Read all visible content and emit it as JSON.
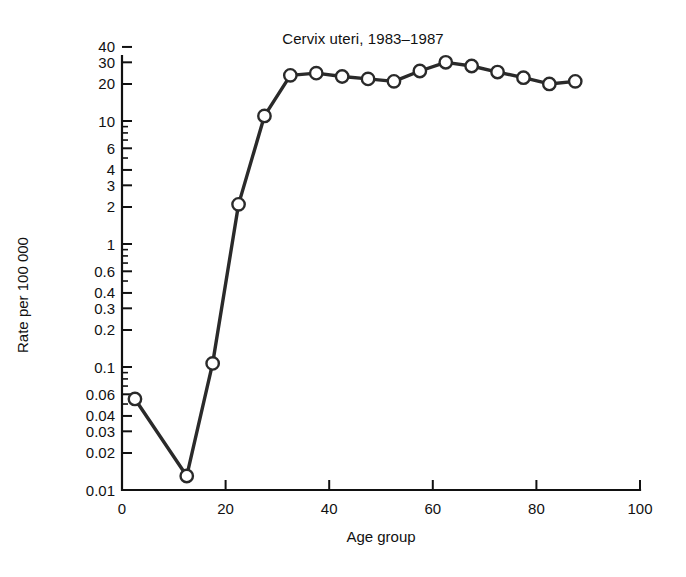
{
  "chart_data": {
    "type": "line",
    "title": "Cervix uteri, 1983–1987",
    "xlabel": "Age group",
    "ylabel": "Rate per 100 000",
    "yscale": "log",
    "xlim": [
      0,
      100
    ],
    "ylim": [
      0.01,
      45
    ],
    "grid": false,
    "legend": null,
    "xticks": [
      0,
      20,
      40,
      60,
      80,
      100
    ],
    "xtick_labels": [
      "0",
      "20",
      "40",
      "60",
      "80",
      "100"
    ],
    "yticks": [
      0.01,
      0.02,
      0.03,
      0.04,
      0.06,
      0.1,
      0.2,
      0.3,
      0.4,
      0.6,
      1,
      2,
      3,
      4,
      6,
      10,
      20,
      30,
      40
    ],
    "ytick_labels": [
      "0.01",
      "0.02",
      "0.03",
      "0.04",
      "0.06",
      "0.1",
      "0.2",
      "0.3",
      "0.4",
      "0.6",
      "1",
      "2",
      "3",
      "4",
      "6",
      "10",
      "20",
      "30",
      "40"
    ],
    "series": [
      {
        "name": "Cervix uteri incidence rate",
        "marker": "open-circle",
        "x": [
          2.5,
          12.5,
          17.5,
          22.5,
          27.5,
          32.5,
          37.5,
          42.5,
          47.5,
          52.5,
          57.5,
          62.5,
          67.5,
          72.5,
          77.5,
          82.5,
          87.5
        ],
        "y": [
          0.055,
          0.013,
          0.107,
          2.1,
          11.0,
          23.5,
          24.5,
          23.0,
          22.0,
          21.0,
          25.5,
          30.0,
          28.0,
          25.0,
          22.5,
          20.0,
          21.0
        ]
      }
    ]
  },
  "axes": {
    "x_tick_count": 6,
    "y_tick_count": 19
  }
}
